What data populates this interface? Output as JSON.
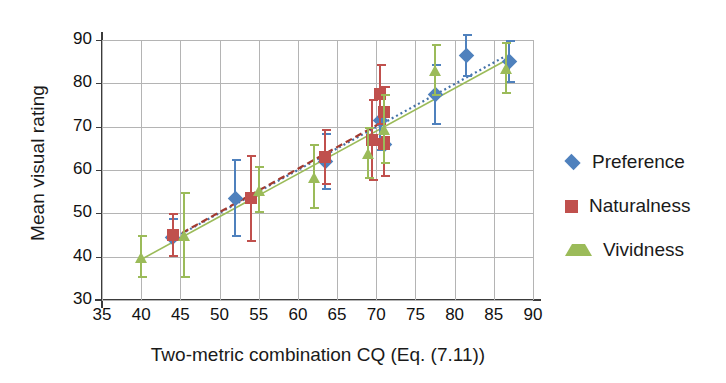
{
  "chart_data": {
    "type": "scatter",
    "title": "",
    "xlabel": "Two-metric combination CQ (Eq. (7.11))",
    "ylabel": "Mean visual rating",
    "xlim": [
      35,
      90
    ],
    "ylim": [
      30,
      90
    ],
    "xticks": [
      35,
      40,
      45,
      50,
      55,
      60,
      65,
      70,
      75,
      80,
      85,
      90
    ],
    "yticks": [
      30,
      40,
      50,
      60,
      70,
      80,
      90
    ],
    "grid": true,
    "legend_position": "right",
    "error_bars": "vertical, symmetric (95% CI)",
    "trendlines": [
      {
        "name": "Preference",
        "style": "dotted",
        "color": "#4472a8"
      },
      {
        "name": "Naturalness",
        "style": "dashed",
        "color": "#a33a2f"
      },
      {
        "name": "Vividness",
        "style": "solid",
        "color": "#9bbb59"
      }
    ],
    "series": [
      {
        "name": "Preference",
        "marker": "diamond",
        "color": "#4f81bd",
        "points": [
          {
            "x": 44.0,
            "y": 44.5,
            "err": 4.5
          },
          {
            "x": 52.0,
            "y": 53.5,
            "err": 9.0
          },
          {
            "x": 63.5,
            "y": 62.0,
            "err": 6.5
          },
          {
            "x": 70.5,
            "y": 71.5,
            "err": 7.0
          },
          {
            "x": 71.0,
            "y": 66.0,
            "err": 7.5
          },
          {
            "x": 77.5,
            "y": 77.5,
            "err": 7.0
          },
          {
            "x": 81.5,
            "y": 86.5,
            "err": 5.0
          },
          {
            "x": 87.0,
            "y": 85.0,
            "err": 5.0
          }
        ]
      },
      {
        "name": "Naturalness",
        "marker": "square",
        "color": "#c0504d",
        "points": [
          {
            "x": 44.0,
            "y": 45.0,
            "err": 5.0
          },
          {
            "x": 54.0,
            "y": 53.5,
            "err": 10.0
          },
          {
            "x": 63.5,
            "y": 63.0,
            "err": 6.5
          },
          {
            "x": 69.5,
            "y": 67.0,
            "err": 9.5
          },
          {
            "x": 70.5,
            "y": 77.5,
            "err": 7.0
          },
          {
            "x": 71.0,
            "y": 73.5,
            "err": 6.0
          },
          {
            "x": 71.0,
            "y": 66.0,
            "err": 7.5
          }
        ]
      },
      {
        "name": "Vividness",
        "marker": "triangle",
        "color": "#9bbb59",
        "points": [
          {
            "x": 40.0,
            "y": 40.0,
            "err": 5.0
          },
          {
            "x": 45.5,
            "y": 45.0,
            "err": 10.0
          },
          {
            "x": 55.0,
            "y": 55.5,
            "err": 5.5
          },
          {
            "x": 62.0,
            "y": 58.5,
            "err": 7.5
          },
          {
            "x": 69.0,
            "y": 64.0,
            "err": 6.0
          },
          {
            "x": 71.0,
            "y": 69.5,
            "err": 8.0
          },
          {
            "x": 77.5,
            "y": 83.0,
            "err": 6.0
          },
          {
            "x": 86.5,
            "y": 83.5,
            "err": 6.0
          }
        ]
      }
    ]
  },
  "legend": {
    "items": [
      {
        "label": "Preference",
        "marker": "diamond",
        "color": "#4f81bd"
      },
      {
        "label": "Naturalness",
        "marker": "square",
        "color": "#c0504d"
      },
      {
        "label": "Vividness",
        "marker": "triangle",
        "color": "#9bbb59"
      }
    ]
  }
}
